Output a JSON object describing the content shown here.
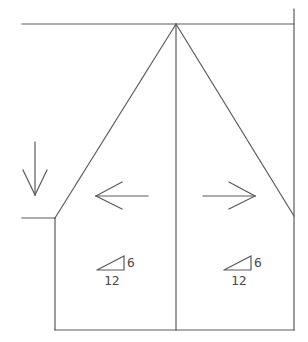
{
  "diagram": {
    "type": "roof-plan-hip",
    "line_color": "#5a5a5a",
    "background": "#ffffff",
    "pitch_left": {
      "rise": "6",
      "run": "12"
    },
    "pitch_right": {
      "rise": "6",
      "run": "12"
    },
    "arrows": [
      {
        "name": "down-arrow",
        "direction": "down"
      },
      {
        "name": "left-arrow",
        "direction": "left"
      },
      {
        "name": "right-arrow",
        "direction": "right"
      }
    ]
  }
}
